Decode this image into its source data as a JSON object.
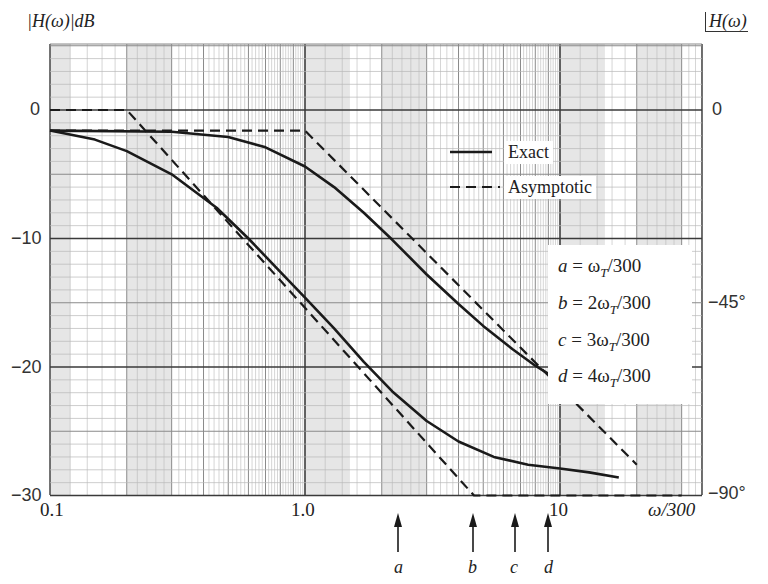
{
  "chart_data": {
    "type": "line",
    "title": "",
    "xlabel": "ω/300",
    "ylabel": "|H(ω)| dB",
    "ylabel_right": "∠H(ω)",
    "xscale": "log",
    "xlim": [
      0.1,
      30
    ],
    "ylim": [
      -30,
      5
    ],
    "grid": true,
    "x_tick_labels": [
      "0.1",
      "1.0",
      "10"
    ],
    "x_ticks": [
      0.1,
      1.0,
      10
    ],
    "y_tick_labels": [
      "0",
      "−10",
      "−20",
      "−30"
    ],
    "y_ticks": [
      0,
      -10,
      -20,
      -30
    ],
    "y_right_tick_labels": [
      "0",
      "−45°",
      "−90°"
    ],
    "y_right_ticks_dB_position": [
      0,
      -15,
      -30
    ],
    "legend": [
      {
        "label": "Exact",
        "style": "solid"
      },
      {
        "label": "Asymptotic",
        "style": "dashed"
      }
    ],
    "legend_position": "upper right (inside)",
    "series": [
      {
        "name": "Asymptotic (lower response)",
        "style": "dashed",
        "x": [
          0.1,
          0.2,
          4.6,
          30
        ],
        "y": [
          0,
          0,
          -30,
          -30
        ]
      },
      {
        "name": "Exact (lower response)",
        "style": "solid",
        "x": [
          0.1,
          0.15,
          0.2,
          0.3,
          0.45,
          0.6,
          0.8,
          1.0,
          1.3,
          1.7,
          2.2,
          3.0,
          4.0,
          5.5,
          7.5,
          10,
          13,
          17
        ],
        "y": [
          -1.6,
          -2.3,
          -3.2,
          -5.0,
          -7.6,
          -10.0,
          -12.6,
          -14.6,
          -17.0,
          -19.6,
          -21.9,
          -24.2,
          -25.8,
          -27.0,
          -27.6,
          -27.9,
          -28.2,
          -28.6
        ]
      },
      {
        "name": "Asymptotic (upper response)",
        "style": "dashed",
        "x": [
          0.1,
          1.0,
          20
        ],
        "y": [
          -1.6,
          -1.6,
          -27.6
        ]
      },
      {
        "name": "Exact (upper response)",
        "style": "solid",
        "x": [
          0.1,
          0.3,
          0.5,
          0.7,
          1.0,
          1.3,
          1.7,
          2.2,
          3.0,
          4.0,
          5.0,
          6.5,
          8.0,
          10
        ],
        "y": [
          -1.6,
          -1.7,
          -2.1,
          -2.9,
          -4.4,
          -6.0,
          -8.0,
          -10.1,
          -12.8,
          -15.1,
          -16.8,
          -18.6,
          -19.9,
          -21.1
        ]
      }
    ],
    "annotations": [
      {
        "label": "a",
        "x": 2.5,
        "definition": "a = ωT/300"
      },
      {
        "label": "b",
        "x": 5.0,
        "definition": "b = 2ωT/300"
      },
      {
        "label": "c",
        "x": 7.5,
        "definition": "c = 3ωT/300"
      },
      {
        "label": "d",
        "x": 10.0,
        "definition": "d = 4ωT/300"
      }
    ]
  },
  "labels": {
    "left_axis_title": "|H(ω)|dB",
    "right_axis_title": "H(ω)",
    "x_axis_title": "ω/300",
    "legend_exact": "Exact",
    "legend_asymptotic": "Asymptotic",
    "definitions": [
      {
        "var": "a",
        "rhs": " = ω",
        "sub": "T",
        "tail": "/300"
      },
      {
        "var": "b",
        "rhs": " = 2ω",
        "sub": "T",
        "tail": "/300"
      },
      {
        "var": "c",
        "rhs": " = 3ω",
        "sub": "T",
        "tail": "/300"
      },
      {
        "var": "d",
        "rhs": " = 4ω",
        "sub": "T",
        "tail": "/300"
      }
    ],
    "arrow_labels": [
      "a",
      "b",
      "c",
      "d"
    ]
  },
  "layout": {
    "plot_left": 50,
    "plot_right": 702,
    "plot_top": 44,
    "plot_bottom": 495,
    "px_per_decade": 255,
    "px_per_dB": 12.85,
    "y_zero_px": 110,
    "arrow_x_px": [
      398,
      473,
      515,
      548
    ]
  },
  "colors": {
    "ink": "#1a1a1a",
    "grid_major": "#3a3a3a",
    "grid_minor": "#8a8a8a",
    "grid_fine": "#b8b8b8",
    "shade": "#e6e6e6"
  }
}
